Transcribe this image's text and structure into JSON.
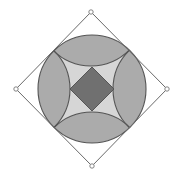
{
  "diagram": {
    "type": "geometric-construction",
    "canvas": {
      "width": 178,
      "height": 179
    },
    "outer_square": {
      "vertices": [
        {
          "name": "top",
          "x": 91,
          "y": 12
        },
        {
          "name": "right",
          "x": 167,
          "y": 89
        },
        {
          "name": "bottom",
          "x": 92,
          "y": 166
        },
        {
          "name": "left",
          "x": 16,
          "y": 89
        }
      ],
      "stroke": "#6a6a6a"
    },
    "circle": {
      "cx": 92,
      "cy": 89,
      "r": 54,
      "stroke": "#555555"
    },
    "vertex_arc_radius": 54,
    "inner_square": {
      "vertices": [
        {
          "x": 92,
          "y": 67
        },
        {
          "x": 114,
          "y": 89
        },
        {
          "x": 92,
          "y": 111
        },
        {
          "x": 70,
          "y": 89
        }
      ]
    },
    "colors": {
      "background": "#ffffff",
      "lens_fill": "#ababab",
      "center_region_fill": "#d6d6d6",
      "inner_square_fill": "#707070",
      "line": "#555555",
      "vertex_marker_fill": "#ffffff",
      "vertex_marker_stroke": "#777777"
    }
  }
}
